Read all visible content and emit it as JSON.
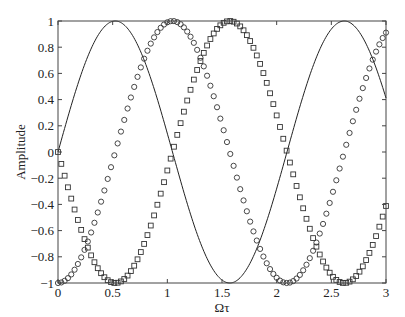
{
  "chart_data": {
    "type": "line",
    "title": "",
    "xlabel": "Ωτ",
    "ylabel": "Amplitude",
    "xlim": [
      0,
      3
    ],
    "ylim": [
      -1,
      1
    ],
    "grid": false,
    "legend": null,
    "xticks": [
      0,
      0.5,
      1,
      1.5,
      2,
      2.5,
      3
    ],
    "xtick_labels": [
      "0",
      "0.5",
      "1",
      "1.5",
      "2",
      "2.5",
      "3"
    ],
    "yticks": [
      -1,
      -0.8,
      -0.6,
      -0.4,
      -0.2,
      0,
      0.2,
      0.4,
      0.6,
      0.8,
      1
    ],
    "ytick_labels": [
      "−1",
      "−0.8",
      "−0.6",
      "−0.4",
      "−0.2",
      "0",
      "0.2",
      "0.4",
      "0.6",
      "0.8",
      "1"
    ],
    "series": [
      {
        "name": "solid-line",
        "style": "line",
        "function": "sin(3x)",
        "description": "solid curve: 0 at x=0, peak 1 at ~0.52, trough -1 at ~1.57, peak 1 at ~2.62, ~0.41 at x=3",
        "samples": 300
      },
      {
        "name": "circles",
        "style": "circle-markers",
        "function": "-cos(3x)",
        "description": "circle markers: -1 at x=0, peak 1 at ~1.05, trough -1 at ~2.09, ~0.91 at x=3",
        "samples": 100
      },
      {
        "name": "squares",
        "style": "square-markers",
        "function": "-sin(3x)",
        "description": "square markers: ~0 at x=0, trough -1 at ~0.52, peak 1 at ~1.57, trough -1 at ~2.62, ~-0.35 at x=3",
        "samples": 100
      }
    ],
    "omega": 3
  },
  "colors": {
    "line": "#222222",
    "markers": "#333333",
    "axes": "#444444"
  }
}
